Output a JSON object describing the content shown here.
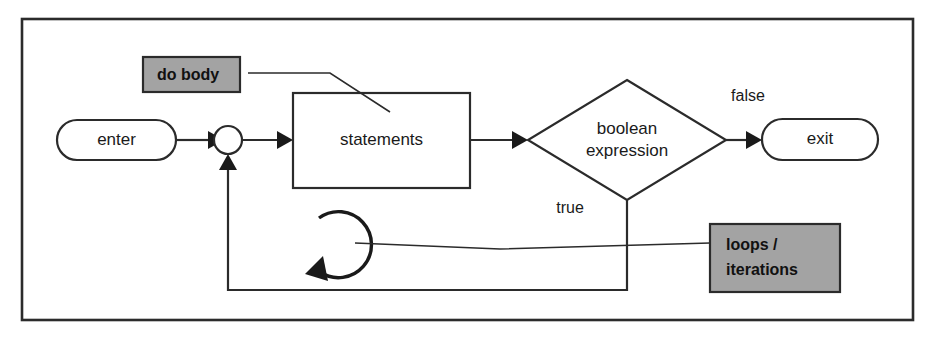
{
  "diagram": {
    "frame": {
      "name": "diagram-border"
    },
    "colors": {
      "stroke": "#2b2b2b",
      "text": "#1a1a1a",
      "annotation_fill": "#a3a3a3",
      "background": "#ffffff"
    },
    "nodes": {
      "enter": {
        "label": "enter",
        "shape": "stadium"
      },
      "junction": {
        "label": "",
        "shape": "circle"
      },
      "statements": {
        "label": "statements",
        "shape": "rectangle"
      },
      "decision": {
        "label_line1": "boolean",
        "label_line2": "expression",
        "shape": "diamond"
      },
      "exit": {
        "label": "exit",
        "shape": "stadium"
      }
    },
    "edge_labels": {
      "false": "false",
      "true": "true"
    },
    "annotations": [
      {
        "label": "do body",
        "shape": "gray-box",
        "lines": [
          "do body"
        ]
      },
      {
        "label": "loops / iterations",
        "shape": "gray-box",
        "lines": [
          "loops /",
          "iterations"
        ]
      }
    ],
    "icons": {
      "loop_arrow": "circular-loop-arrow-icon"
    }
  }
}
